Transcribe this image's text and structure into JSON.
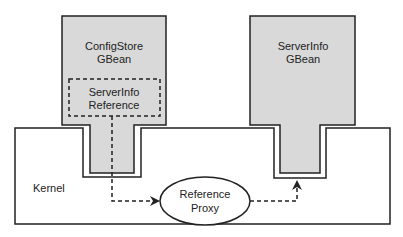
{
  "diagram": {
    "config_store": {
      "line1": "ConfigStore",
      "line2": "GBean"
    },
    "server_info_ref": {
      "line1": "ServerInfo",
      "line2": "Reference"
    },
    "server_info": {
      "line1": "ServerInfo",
      "line2": "GBean"
    },
    "kernel": {
      "label": "Kernel"
    },
    "proxy": {
      "line1": "Reference",
      "line2": "Proxy"
    },
    "colors": {
      "gbean_fill": "#d9d9d9",
      "stroke": "#222222",
      "background": "#ffffff"
    }
  }
}
